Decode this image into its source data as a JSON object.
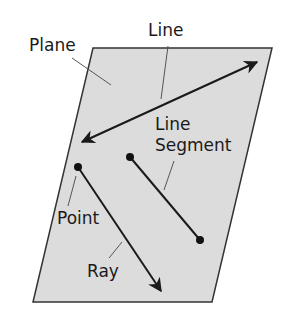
{
  "diagram": {
    "labels": {
      "plane": "Plane",
      "line": "Line",
      "segment_1": "Line",
      "segment_2": "Segment",
      "point": "Point",
      "ray": "Ray"
    },
    "colors": {
      "plane_fill": "#dcdcdc",
      "stroke": "#1a1a1a",
      "leader": "#555555"
    },
    "plane": {
      "points": "93,48 272,48 212,302 33,302"
    },
    "line": {
      "x1": 82,
      "y1": 142,
      "x2": 257,
      "y2": 62
    },
    "ray": {
      "x1": 78,
      "y1": 167,
      "x2": 163,
      "y2": 293
    },
    "segment": {
      "x1": 130,
      "y1": 157,
      "x2": 200,
      "y2": 240
    }
  }
}
